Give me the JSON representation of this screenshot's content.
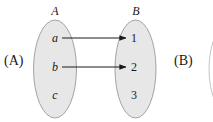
{
  "figure": {
    "background_color": "#ffffff",
    "ellipse_fill": "#e7e7e7",
    "ellipse_stroke": "#9a9a9a",
    "arrow_color": "#1a1a1a"
  },
  "panels": [
    {
      "id": "A",
      "label": "(A)"
    },
    {
      "id": "B",
      "label": "(B)"
    }
  ],
  "sets": [
    {
      "name": "A",
      "label": "A",
      "elements": [
        {
          "label": "a"
        },
        {
          "label": "b"
        },
        {
          "label": "c"
        }
      ]
    },
    {
      "name": "B",
      "label": "B",
      "elements": [
        {
          "label": "1"
        },
        {
          "label": "2"
        },
        {
          "label": "3"
        }
      ]
    }
  ],
  "mappings": [
    {
      "from": "a",
      "to": "1"
    },
    {
      "from": "b",
      "to": "2"
    }
  ]
}
